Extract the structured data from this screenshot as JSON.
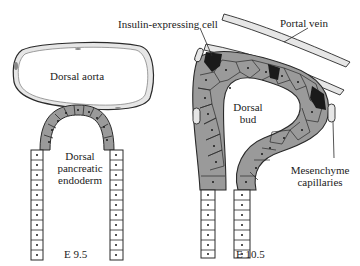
{
  "diagram": {
    "panels": [
      {
        "stage": "E 9.5",
        "labels": {
          "aorta": "Dorsal aorta",
          "endoderm_line1": "Dorsal",
          "endoderm_line2": "pancreatic",
          "endoderm_line3": "endoderm"
        }
      },
      {
        "stage": "E 10.5",
        "labels": {
          "insulin_cell": "Insulin-expressing cell",
          "portal_vein": "Portal vein",
          "bud_line1": "Dorsal",
          "bud_line2": "bud",
          "mesenchyme_line1": "Mesenchyme",
          "mesenchyme_line2": "capillaries"
        }
      }
    ],
    "colors": {
      "line": "#2a2a2a",
      "shaded_epithelium": "#9a9a9a",
      "insulin_cell": "#1a1a1a",
      "vessel_wall": "#d8d8d8",
      "background": "#ffffff"
    }
  }
}
